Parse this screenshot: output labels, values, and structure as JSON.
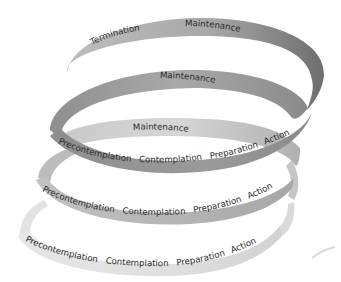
{
  "diagram": {
    "type": "spiral-ribbon",
    "levels": [
      {
        "name": "top",
        "labels": [
          "Termination",
          "Maintenance"
        ]
      },
      {
        "name": "upper-middle",
        "labels": [
          "Maintenance"
        ]
      },
      {
        "name": "middle",
        "labels": [
          "Maintenance",
          "Precontemplation",
          "Contemplation",
          "Preparation",
          "Action"
        ]
      },
      {
        "name": "lower-middle",
        "labels": [
          "Precontemplation",
          "Contemplation",
          "Preparation",
          "Action"
        ]
      },
      {
        "name": "bottom",
        "labels": [
          "Precontemplation",
          "Contemplation",
          "Preparation",
          "Action"
        ]
      }
    ],
    "colors": {
      "dark": "#7a7a7a",
      "mid": "#a5a5a5",
      "light": "#dcdcdc",
      "text": "#2a2a2a"
    }
  }
}
